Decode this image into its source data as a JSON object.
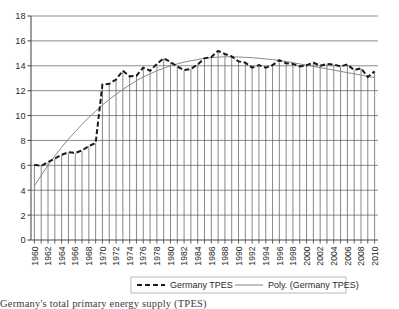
{
  "chart_data": {
    "type": "line",
    "title": "",
    "xlabel": "",
    "ylabel": "",
    "ylim": [
      0,
      18
    ],
    "ytick_step": 2,
    "yticks": [
      "0",
      "2",
      "4",
      "6",
      "8",
      "10",
      "12",
      "14",
      "16",
      "18"
    ],
    "xlim": [
      1960,
      2011
    ],
    "xticks_visible": [
      "1960",
      "1962",
      "1964",
      "1966",
      "1968",
      "1970",
      "1972",
      "1974",
      "1976",
      "1978",
      "1980",
      "1982",
      "1984",
      "1986",
      "1988",
      "1990",
      "1992",
      "1994",
      "1996",
      "1998",
      "2000",
      "2002",
      "2004",
      "2006",
      "2008",
      "2010"
    ],
    "grid": true,
    "grid_axis": "y",
    "legend_position": "bottom-center",
    "x": [
      1960,
      1961,
      1962,
      1963,
      1964,
      1965,
      1966,
      1967,
      1968,
      1969,
      1970,
      1971,
      1972,
      1973,
      1974,
      1975,
      1976,
      1977,
      1978,
      1979,
      1980,
      1981,
      1982,
      1983,
      1984,
      1985,
      1986,
      1987,
      1988,
      1989,
      1990,
      1991,
      1992,
      1993,
      1994,
      1995,
      1996,
      1997,
      1998,
      1999,
      2000,
      2001,
      2002,
      2003,
      2004,
      2005,
      2006,
      2007,
      2008,
      2009,
      2010
    ],
    "series": [
      {
        "name": "Germany TPES",
        "style": "dashed-with-droplines",
        "color": "#1a1a1a",
        "values": [
          6.05,
          5.95,
          6.25,
          6.55,
          6.85,
          7.05,
          7.0,
          7.2,
          7.55,
          7.8,
          12.5,
          12.55,
          12.9,
          13.6,
          13.15,
          13.2,
          13.85,
          13.6,
          14.15,
          14.6,
          14.3,
          13.95,
          13.65,
          13.75,
          14.1,
          14.6,
          14.7,
          15.2,
          14.95,
          14.75,
          14.35,
          14.25,
          13.85,
          14.05,
          13.85,
          14.05,
          14.45,
          14.2,
          14.15,
          13.95,
          14.05,
          14.25,
          14.0,
          14.15,
          14.1,
          13.95,
          14.1,
          13.65,
          13.8,
          13.1,
          13.55
        ]
      },
      {
        "name": "Poly. (Germany TPES)",
        "style": "smooth-solid",
        "color": "#8a8a8a",
        "values": [
          4.35,
          5.2,
          6.0,
          6.75,
          7.45,
          8.1,
          8.7,
          9.3,
          9.85,
          10.35,
          10.85,
          11.3,
          11.7,
          12.1,
          12.45,
          12.8,
          13.1,
          13.35,
          13.6,
          13.8,
          14.0,
          14.15,
          14.3,
          14.4,
          14.5,
          14.6,
          14.65,
          14.7,
          14.72,
          14.72,
          14.7,
          14.68,
          14.65,
          14.6,
          14.55,
          14.5,
          14.42,
          14.35,
          14.25,
          14.15,
          14.05,
          13.95,
          13.85,
          13.75,
          13.65,
          13.55,
          13.45,
          13.35,
          13.25,
          13.15,
          13.05
        ]
      }
    ],
    "legend": [
      {
        "label": "Germany TPES",
        "marker": "dashed-line",
        "color": "#1a1a1a"
      },
      {
        "label": "Poly. (Germany TPES)",
        "marker": "solid-line",
        "color": "#8a8a8a"
      }
    ],
    "colors": {
      "series_primary": "#1a1a1a",
      "trendline": "#8a8a8a",
      "gridline": "#808080",
      "axis": "#4d4d4d",
      "plot_background": "#ffffff",
      "dropline": "#555555"
    }
  },
  "caption": {
    "text": "Germany's total primary energy supply (TPES)"
  }
}
